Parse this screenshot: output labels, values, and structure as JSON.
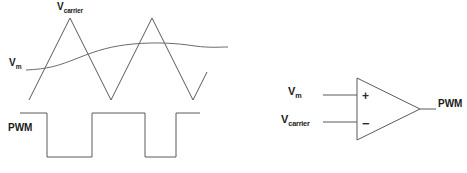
{
  "figure": {
    "title_present": false,
    "background_color": "#ffffff",
    "line_color": "#5a5a5a",
    "text_color": "#1a1a1a"
  },
  "waveform_panel": {
    "labels": {
      "carrier": {
        "base": "V",
        "sub": "carrier"
      },
      "modulating": {
        "base": "V",
        "sub": "m"
      },
      "pwm": "PWM"
    },
    "paths": {
      "triangle_carrier": "M29,100 L70,18 L111,100 L152,18 L193,100 L207,72",
      "sine_modulating": "M26,70 C48,69 58,66 78,58 C98,50 112,46 133,44 C156,42 176,43 195,46 C210,48 220,47 228,47",
      "pwm_square": "M20,113 L47,113 L47,157 L92,157 L92,113 L145,113 L145,157 L176,157 L176,113 L200,113"
    }
  },
  "comparator_panel": {
    "labels": {
      "noninverting_input": {
        "base": "V",
        "sub": "m"
      },
      "inverting_input": {
        "base": "V",
        "sub": "carrier"
      },
      "output": "PWM",
      "plus": "+",
      "minus": "−"
    },
    "paths": {
      "body_triangle": "M357,78 L357,140 L420,109 Z",
      "input_lead_plus": "M323,95 L357,95",
      "input_lead_minus": "M323,122 L357,122",
      "output_lead": "M420,109 L436,109"
    }
  },
  "chart_data": {
    "type": "line",
    "xlabel": "",
    "ylabel": "",
    "grid": false,
    "legend": "inline-annotations",
    "series": [
      {
        "name": "V_carrier",
        "description": "triangular carrier wave, two full periods",
        "points": [
          [
            29,
            100
          ],
          [
            70,
            18
          ],
          [
            111,
            100
          ],
          [
            152,
            18
          ],
          [
            193,
            100
          ],
          [
            207,
            72
          ]
        ]
      },
      {
        "name": "V_m",
        "description": "slow sinusoidal modulating signal",
        "points": [
          [
            26,
            70
          ],
          [
            78,
            58
          ],
          [
            133,
            44
          ],
          [
            195,
            46
          ],
          [
            228,
            47
          ]
        ]
      },
      {
        "name": "PWM",
        "description": "comparator output, high when V_m exceeds V_carrier",
        "points": [
          [
            20,
            113
          ],
          [
            47,
            113
          ],
          [
            47,
            157
          ],
          [
            92,
            157
          ],
          [
            92,
            113
          ],
          [
            145,
            113
          ],
          [
            145,
            157
          ],
          [
            176,
            157
          ],
          [
            176,
            113
          ],
          [
            200,
            113
          ]
        ]
      }
    ]
  }
}
